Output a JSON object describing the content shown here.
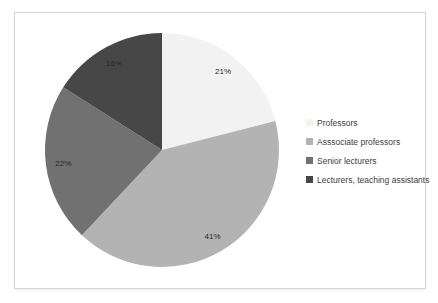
{
  "chart_data": {
    "type": "pie",
    "title": "",
    "start_angle_deg": 0,
    "direction": "clockwise",
    "data_labels": "percent",
    "legend_position": "right",
    "slices": [
      {
        "label": "Professors",
        "value": 21,
        "pct_label": "21%",
        "color": "#f2f2f2"
      },
      {
        "label": "Asssociate professors",
        "value": 41,
        "pct_label": "41%",
        "color": "#b3b3b3"
      },
      {
        "label": "Senior lecturers",
        "value": 22,
        "pct_label": "22%",
        "color": "#717171"
      },
      {
        "label": "Lecturers, teaching assistants",
        "value": 16,
        "pct_label": "16%",
        "color": "#474747"
      }
    ]
  },
  "colors": {
    "frame_border": "#d6d6d6",
    "background": "#ffffff",
    "slice_label_text": "#262626",
    "legend_text": "#404040"
  }
}
